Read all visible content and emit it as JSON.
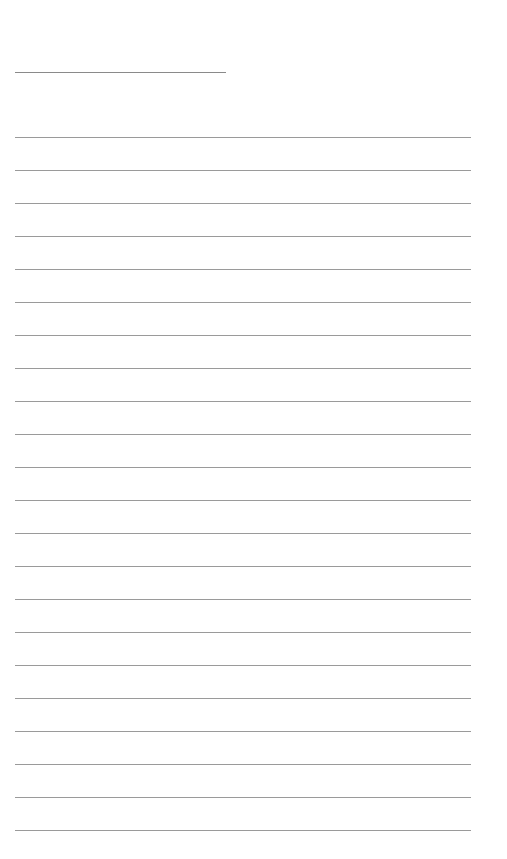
{
  "document": {
    "type": "lined-sheet",
    "title_line_text": "",
    "ruled_line_count": 22,
    "lines": [
      "",
      "",
      "",
      "",
      "",
      "",
      "",
      "",
      "",
      "",
      "",
      "",
      "",
      "",
      "",
      "",
      "",
      "",
      "",
      "",
      "",
      ""
    ],
    "colors": {
      "background": "#ffffff",
      "line": "#9a9a9a"
    }
  }
}
